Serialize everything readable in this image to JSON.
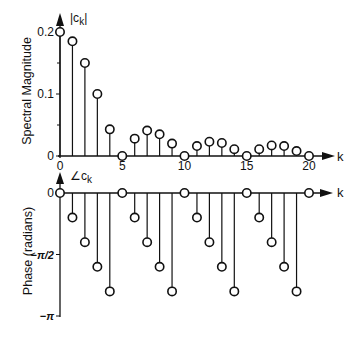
{
  "chart_data": [
    {
      "type": "stem",
      "title": "",
      "ylabel": "Spectral Magnitude",
      "xlabel": "k",
      "series_label": "|c_k|",
      "xlim": [
        0,
        21
      ],
      "ylim": [
        0,
        0.2
      ],
      "yticks": [
        0,
        0.1,
        0.2
      ],
      "ytick_labels": [
        "0",
        "0.1",
        "0.2"
      ],
      "minor_yticks": [
        0.05,
        0.15
      ],
      "xticks": [
        0,
        5,
        10,
        15,
        20
      ],
      "xtick_labels": [
        "0",
        "5",
        "10",
        "15",
        "20"
      ],
      "grid": false,
      "marker": "open-circle",
      "k": [
        0,
        1,
        2,
        3,
        4,
        5,
        6,
        7,
        8,
        9,
        10,
        11,
        12,
        13,
        14,
        15,
        16,
        17,
        18,
        19,
        20
      ],
      "values": [
        0.2,
        0.185,
        0.15,
        0.1,
        0.043,
        0,
        0.028,
        0.041,
        0.035,
        0.02,
        0,
        0.016,
        0.023,
        0.021,
        0.011,
        0,
        0.011,
        0.017,
        0.016,
        0.008,
        0
      ]
    },
    {
      "type": "stem",
      "title": "",
      "ylabel": "Phase (radians)",
      "xlabel": "k",
      "series_label": "∠c_k",
      "xlim": [
        0,
        21
      ],
      "ylim": [
        -3.1416,
        0
      ],
      "yticks": [
        0,
        -1.5708,
        -3.1416
      ],
      "ytick_labels": [
        "0",
        "−π/2",
        "−π"
      ],
      "grid": false,
      "marker": "open-circle",
      "k": [
        0,
        1,
        2,
        3,
        4,
        5,
        6,
        7,
        8,
        9,
        10,
        11,
        12,
        13,
        14,
        15,
        16,
        17,
        18,
        19,
        20
      ],
      "values_in_pi": [
        0,
        -0.2,
        -0.4,
        -0.6,
        -0.8,
        0,
        -0.2,
        -0.4,
        -0.6,
        -0.8,
        0,
        -0.2,
        -0.4,
        -0.6,
        -0.8,
        0,
        -0.2,
        -0.4,
        -0.6,
        -0.8,
        0
      ],
      "values": [
        0,
        -0.628,
        -1.257,
        -1.885,
        -2.513,
        0,
        -0.628,
        -1.257,
        -1.885,
        -2.513,
        0,
        -0.628,
        -1.257,
        -1.885,
        -2.513,
        0,
        -0.628,
        -1.257,
        -1.885,
        -2.513,
        0
      ]
    }
  ],
  "labels": {
    "mag_ylabel": "Spectral Magnitude",
    "mag_series": "|c",
    "mag_series_sub": "k",
    "phase_ylabel": "Phase (radians)",
    "phase_series": "∠c",
    "phase_series_sub": "k",
    "x_axis_letter": "k"
  },
  "colors": {
    "ink": "#111111",
    "background": "#ffffff"
  }
}
